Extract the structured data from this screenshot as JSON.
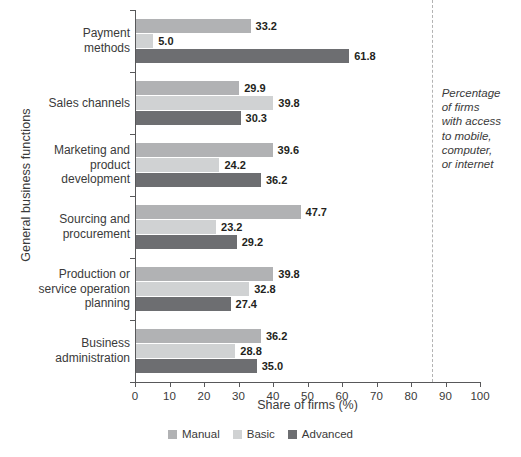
{
  "chart_data": {
    "type": "bar",
    "orientation": "horizontal",
    "title": "",
    "xlabel": "Share of firms (%)",
    "ylabel": "General business functions",
    "xlim": [
      0,
      100
    ],
    "xticks": [
      0,
      10,
      20,
      30,
      40,
      50,
      60,
      70,
      80,
      90,
      100
    ],
    "grid": false,
    "legend_position": "bottom",
    "categories": [
      "Payment methods",
      "Sales channels",
      "Marketing and product development",
      "Sourcing and procurement",
      "Production or service operation planning",
      "Business administration"
    ],
    "category_label_lines": [
      [
        "Payment",
        "methods"
      ],
      [
        "Sales channels"
      ],
      [
        "Marketing and",
        "product",
        "development"
      ],
      [
        "Sourcing and",
        "procurement"
      ],
      [
        "Production or",
        "service operation",
        "planning"
      ],
      [
        "Business",
        "administration"
      ]
    ],
    "series": [
      {
        "name": "Manual",
        "color": "#b1b2b4",
        "values": [
          33.2,
          29.9,
          39.6,
          47.7,
          39.8,
          36.2
        ]
      },
      {
        "name": "Basic",
        "color": "#d0d2d3",
        "values": [
          5.0,
          39.8,
          24.2,
          23.2,
          32.8,
          28.8
        ]
      },
      {
        "name": "Advanced",
        "color": "#6d6e71",
        "values": [
          61.8,
          30.3,
          36.2,
          29.2,
          27.4,
          35.0
        ]
      }
    ],
    "value_labels": [
      [
        "33.2",
        "5.0",
        "61.8"
      ],
      [
        "29.9",
        "39.8",
        "30.3"
      ],
      [
        "39.6",
        "24.2",
        "36.2"
      ],
      [
        "47.7",
        "23.2",
        "29.2"
      ],
      [
        "39.8",
        "32.8",
        "27.4"
      ],
      [
        "36.2",
        "28.8",
        "35.0"
      ]
    ],
    "reference_line": {
      "value": 86,
      "style": "dashed",
      "color": "#b3b3b3",
      "annotation_lines": [
        "Percentage",
        "of firms",
        "with access",
        "to mobile,",
        "computer,",
        "or internet"
      ]
    }
  },
  "legend": {
    "items": [
      {
        "label": "Manual",
        "color": "#b1b2b4"
      },
      {
        "label": "Basic",
        "color": "#d0d2d3"
      },
      {
        "label": "Advanced",
        "color": "#6d6e71"
      }
    ]
  },
  "axes": {
    "x_title": "Share of firms (%)",
    "y_title": "General business functions",
    "x_tick_labels": [
      "0",
      "10",
      "20",
      "30",
      "40",
      "50",
      "60",
      "70",
      "80",
      "90",
      "100"
    ]
  }
}
